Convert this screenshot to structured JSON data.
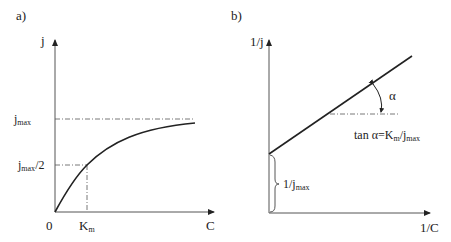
{
  "panels": [
    {
      "id": "a",
      "label": "a)",
      "y_axis": "j",
      "x_axis": "C",
      "origin": "0",
      "ticks_y": [
        {
          "base": "j",
          "sub": "max",
          "suffix": ""
        },
        {
          "base": "j",
          "sub": "max",
          "suffix": "/2"
        }
      ],
      "ticks_x": [
        {
          "base": "K",
          "sub": "m"
        }
      ],
      "curve": "Michaelis-Menten saturation curve"
    },
    {
      "id": "b",
      "label": "b)",
      "y_axis": "1/j",
      "x_axis": "1/C",
      "angle_symbol": "α",
      "slope_label": {
        "prefix": "tan α=K",
        "sub1": "m",
        "mid": "/j",
        "sub2": "max"
      },
      "intercept_label": {
        "base": "1/j",
        "sub": "max"
      },
      "curve": "Lineweaver-Burk straight line"
    }
  ]
}
